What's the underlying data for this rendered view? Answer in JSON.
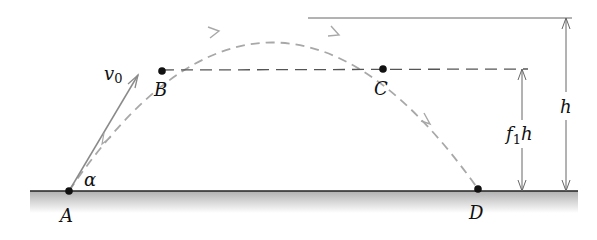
{
  "diagram": {
    "colors": {
      "ground_line": "#222222",
      "ground_fill_top": "#b5b5b5",
      "ground_fill_bottom": "#ffffff",
      "trajectory": "#a8a8a8",
      "velocity_vector": "#8a8a8a",
      "dashed_level": "#555555",
      "dimension": "#666666",
      "points": "#111111"
    },
    "points": [
      {
        "id": "A",
        "label": "A",
        "x": 69,
        "y": 191
      },
      {
        "id": "B",
        "label": "B",
        "x": 162,
        "y": 71
      },
      {
        "id": "C",
        "label": "C",
        "x": 383,
        "y": 69
      },
      {
        "id": "D",
        "label": "D",
        "x": 478,
        "y": 189
      }
    ],
    "labels": {
      "velocity": "v",
      "velocity_sub": "0",
      "angle": "α",
      "f1h_f": "f",
      "f1h_sub": "1",
      "f1h_h": "h",
      "h": "h"
    }
  }
}
